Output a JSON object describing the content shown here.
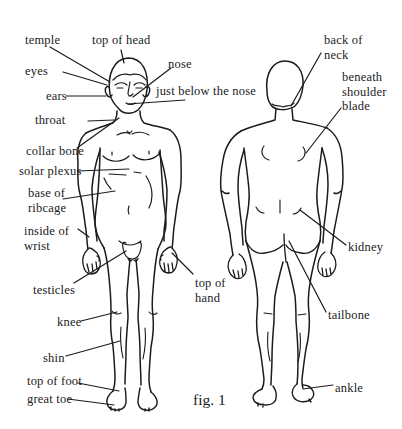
{
  "diagram": {
    "caption": "fig. 1",
    "colors": {
      "ink": "#1b1b1b",
      "paper": "#ffffff"
    },
    "labels": {
      "temple": "temple",
      "top_of_head": "top of head",
      "eyes": "eyes",
      "nose": "nose",
      "ears": "ears",
      "just_below_the_nose": "just below the nose",
      "throat": "throat",
      "collar_bone": "collar bone",
      "solar_plexus": "solar plexus",
      "base_of_ribcage": "base of ribcage",
      "inside_of_wrist": "inside of wrist",
      "testicles": "testicles",
      "top_of_hand": "top of hand",
      "knee": "knee",
      "shin": "shin",
      "top_of_foot": "top of foot",
      "great_toe": "great toe",
      "back_of_neck": "back of neck",
      "beneath_shoulder_blade": "beneath shoulder blade",
      "kidney": "kidney",
      "tailbone": "tailbone",
      "ankle": "ankle"
    }
  }
}
